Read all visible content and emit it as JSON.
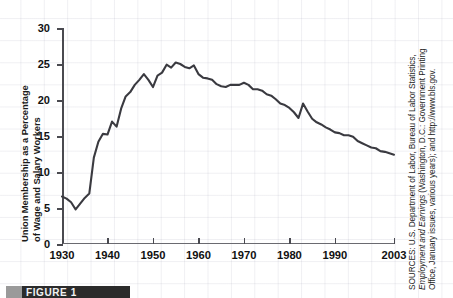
{
  "chart_data": {
    "type": "line",
    "title": "",
    "xlabel": "",
    "ylabel": "Union Membership as a Percentage of Wage and Salary Workers",
    "ylabel_line1": "Union Membership as a Percentage",
    "ylabel_line2": "of Wage and Salary Workers",
    "xlim": [
      1930,
      2003
    ],
    "ylim": [
      0,
      30
    ],
    "yticks": [
      0,
      5,
      10,
      15,
      20,
      25,
      30
    ],
    "ytick_labels": [
      "0",
      "5",
      "10",
      "15",
      "20",
      "25",
      "30"
    ],
    "xticks": [
      1930,
      1940,
      1950,
      1960,
      1970,
      1980,
      1990,
      2003
    ],
    "xtick_labels": [
      "1930",
      "1940",
      "1950",
      "1960",
      "1970",
      "1980",
      "1990",
      "2003"
    ],
    "grid": true,
    "legend": "none",
    "series": [
      {
        "name": "Union membership as a percentage of wage and salary workers",
        "color": "#3a3a40",
        "x": [
          1930,
          1931,
          1932,
          1933,
          1934,
          1935,
          1936,
          1937,
          1938,
          1939,
          1940,
          1941,
          1942,
          1943,
          1944,
          1945,
          1946,
          1947,
          1948,
          1949,
          1950,
          1951,
          1952,
          1953,
          1954,
          1955,
          1956,
          1957,
          1958,
          1959,
          1960,
          1961,
          1962,
          1963,
          1964,
          1965,
          1966,
          1967,
          1968,
          1969,
          1970,
          1971,
          1972,
          1973,
          1974,
          1975,
          1976,
          1977,
          1978,
          1979,
          1980,
          1981,
          1982,
          1983,
          1984,
          1985,
          1986,
          1987,
          1988,
          1989,
          1990,
          1991,
          1992,
          1993,
          1994,
          1995,
          1996,
          1997,
          1998,
          1999,
          2000,
          2001,
          2002,
          2003
        ],
        "values": [
          6.6,
          6.3,
          5.8,
          4.8,
          5.6,
          6.4,
          7.0,
          12.0,
          14.2,
          15.3,
          15.2,
          17.0,
          16.3,
          18.8,
          20.5,
          21.1,
          22.1,
          22.8,
          23.6,
          22.8,
          21.8,
          23.4,
          23.8,
          24.9,
          24.5,
          25.2,
          25.0,
          24.6,
          24.4,
          24.8,
          23.6,
          23.1,
          23.0,
          22.8,
          22.2,
          21.9,
          21.8,
          22.1,
          22.1,
          22.1,
          22.4,
          22.1,
          21.5,
          21.5,
          21.3,
          20.8,
          20.6,
          20.1,
          19.5,
          19.3,
          18.9,
          18.3,
          17.5,
          19.5,
          18.4,
          17.4,
          16.9,
          16.6,
          16.2,
          15.9,
          15.5,
          15.4,
          15.1,
          15.1,
          14.9,
          14.3,
          14.0,
          13.7,
          13.4,
          13.3,
          12.9,
          12.8,
          12.6,
          12.4
        ]
      }
    ],
    "annotations": []
  },
  "source_note": {
    "line1": "SOURCES: U.S. Department of Labor, Bureau of Labor Statistics,",
    "line2_italic": "Employment and Earnings",
    "line2_rest": " (Washington, D.C.: Government Printing",
    "line3": "Office, January issues, various years); and http://www.bls.gov."
  },
  "caption": {
    "label": "FIGURE 1"
  },
  "colors": {
    "series_line": "#3a3a40",
    "axis": "#4a4a50",
    "grid": "#a0a0b4",
    "text": "#111111",
    "caption_bar": "#2b2b2b",
    "caption_swatch": "#9a9a9a"
  }
}
